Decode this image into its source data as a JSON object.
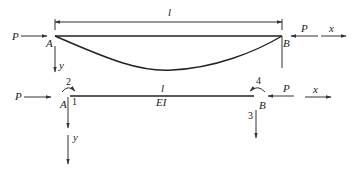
{
  "top_figure": {
    "length_label": "l",
    "left_force_label": "P",
    "right_force_label": "P",
    "left_support_label": "A",
    "right_support_label": "B",
    "x_axis_label": "x",
    "y_axis_label": "y"
  },
  "bottom_figure": {
    "length_label": "l",
    "stiffness_label": "EI",
    "left_force_label": "P",
    "right_force_label": "P",
    "left_node_label": "A",
    "right_node_label": "B",
    "x_axis_label": "x",
    "y_axis_label": "y",
    "dof_labels": [
      "1",
      "2",
      "3",
      "4"
    ]
  },
  "colors": {
    "line": "#222222",
    "background": "#ffffff"
  }
}
